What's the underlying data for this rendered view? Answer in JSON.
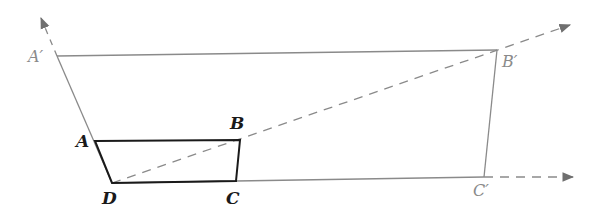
{
  "diagram": {
    "type": "homothety-enlargement",
    "center": "D",
    "colors": {
      "original": "#1a1a1a",
      "image": "#8a8a8a",
      "rays": "#8a8a8a",
      "background": "#ffffff"
    },
    "original_shape": {
      "vertices": [
        "A",
        "B",
        "C",
        "D"
      ],
      "points": {
        "A": [
          95,
          141
        ],
        "B": [
          240,
          140
        ],
        "C": [
          236,
          181
        ],
        "D": [
          112,
          183
        ]
      }
    },
    "image_shape": {
      "vertices": [
        "A'",
        "B'",
        "C'",
        "D"
      ],
      "points": {
        "A'": [
          57,
          56
        ],
        "B'": [
          497,
          50
        ],
        "C'": [
          484,
          177
        ]
      }
    },
    "rays": [
      {
        "from": "D",
        "through": "A",
        "to": [
          40,
          15
        ],
        "dashed_from": [
          57,
          56
        ]
      },
      {
        "from": "D",
        "through": "B",
        "to": [
          572,
          24
        ],
        "dashed": true
      },
      {
        "from": "D",
        "through": "C",
        "to": [
          574,
          177
        ],
        "dashed_from": [
          484,
          177
        ]
      }
    ],
    "labels": {
      "A": "A",
      "B": "B",
      "C": "C",
      "D": "D",
      "A_prime": "A′",
      "B_prime": "B′",
      "C_prime": "C′"
    }
  }
}
